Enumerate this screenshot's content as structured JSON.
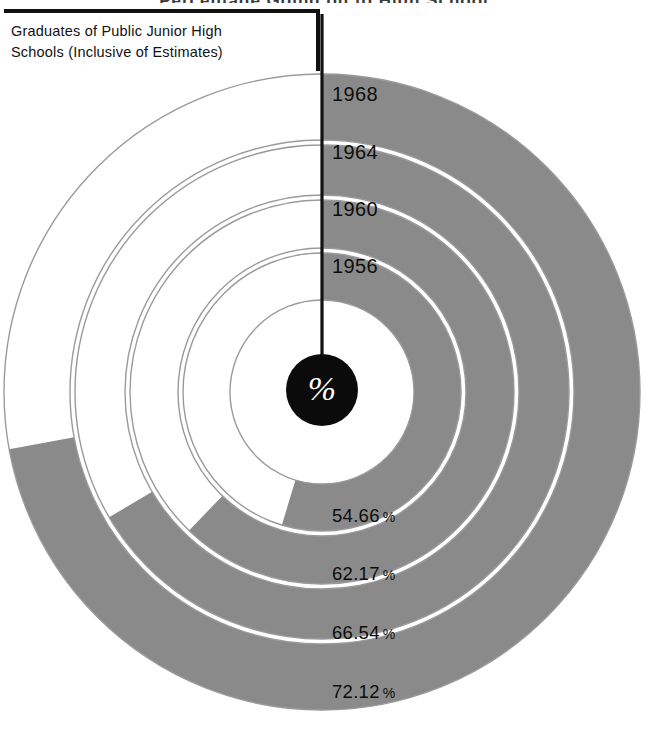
{
  "chart_title": "Percentage Going on to High School",
  "legend": {
    "line1": "Graduates of Public Junior High",
    "line2": "Schools (Inclusive of Estimates)"
  },
  "center": {
    "symbol": "%",
    "icon": "percent-symbol"
  },
  "colors": {
    "arc_filled": "#8a8a8a",
    "arc_empty": "#ffffff",
    "arc_outline": "#9a9a9a",
    "axis_line": "#111111",
    "center_disc": "#0b0b0b",
    "text": "#0d0d0d"
  },
  "rings": [
    {
      "year": "1968",
      "percent_label": "72.12",
      "percent_sign": "%",
      "value": 72.12,
      "index": 0,
      "outer_radius": 318,
      "inner_radius": 252
    },
    {
      "year": "1964",
      "percent_label": "66.54",
      "percent_sign": "%",
      "value": 66.54,
      "index": 1,
      "outer_radius": 247,
      "inner_radius": 197
    },
    {
      "year": "1960",
      "percent_label": "62.17",
      "percent_sign": "%",
      "value": 62.17,
      "index": 2,
      "outer_radius": 192,
      "inner_radius": 144
    },
    {
      "year": "1956",
      "percent_label": "54.66",
      "percent_sign": "%",
      "value": 54.66,
      "index": 3,
      "outer_radius": 139,
      "inner_radius": 92
    }
  ],
  "chart_data": {
    "type": "pie",
    "subtype": "concentric-radial-progress",
    "title": "Percentage Going on to High School",
    "xlabel": "",
    "ylabel": "",
    "unit": "%",
    "ylim": [
      0,
      100
    ],
    "grid": false,
    "legend_position": "top-left",
    "legend_entries": [
      "Graduates of Public Junior High Schools (Inclusive of Estimates)"
    ],
    "categories": [
      "1956",
      "1960",
      "1964",
      "1968"
    ],
    "values": [
      54.66,
      62.17,
      66.54,
      72.12
    ],
    "data_labels": [
      "54.66 %",
      "62.17 %",
      "66.54 %",
      "72.12 %"
    ],
    "annotations": [
      "%"
    ]
  }
}
